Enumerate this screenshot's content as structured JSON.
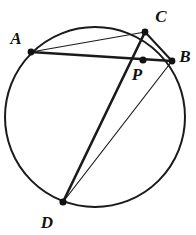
{
  "figure": {
    "width": 196,
    "height": 235,
    "background_color": "#ffffff",
    "stroke_color": "#1a1a1a"
  },
  "circle": {
    "name": "circumscribed-circle",
    "cx": 95,
    "cy": 117,
    "r": 90,
    "stroke_width": 2.0,
    "fill": "none"
  },
  "points": [
    {
      "id": "A",
      "label": "A",
      "x": 31,
      "y": 52,
      "label_x": 16,
      "label_y": 44,
      "dot_r": 3.4
    },
    {
      "id": "C",
      "label": "C",
      "x": 145,
      "y": 32,
      "label_x": 161,
      "label_y": 22,
      "dot_r": 3.4
    },
    {
      "id": "B",
      "label": "B",
      "x": 172,
      "y": 61,
      "label_x": 185,
      "label_y": 62,
      "dot_r": 3.4
    },
    {
      "id": "P",
      "label": "P",
      "x": 143,
      "y": 60,
      "label_x": 137,
      "label_y": 80,
      "dot_r": 3.6
    },
    {
      "id": "D",
      "label": "D",
      "x": 63,
      "y": 202,
      "label_x": 47,
      "label_y": 228,
      "dot_r": 3.6
    }
  ],
  "segments": [
    {
      "id": "AC",
      "name": "chord-a-c",
      "x1": 31,
      "y1": 52,
      "x2": 145,
      "y2": 32,
      "stroke_width": 1.2
    },
    {
      "id": "AB",
      "name": "chord-a-b",
      "x1": 31,
      "y1": 52,
      "x2": 172,
      "y2": 61,
      "stroke_width": 2.6
    },
    {
      "id": "CD",
      "name": "chord-c-d",
      "x1": 145,
      "y1": 32,
      "x2": 63,
      "y2": 202,
      "stroke_width": 2.6
    },
    {
      "id": "CB",
      "name": "chord-c-b",
      "x1": 145,
      "y1": 32,
      "x2": 172,
      "y2": 61,
      "stroke_width": 2.0
    },
    {
      "id": "BD",
      "name": "chord-b-d",
      "x1": 172,
      "y1": 61,
      "x2": 63,
      "y2": 202,
      "stroke_width": 1.2
    }
  ],
  "intersection": {
    "point_id": "P",
    "of_chords": [
      "AB",
      "CD"
    ]
  }
}
